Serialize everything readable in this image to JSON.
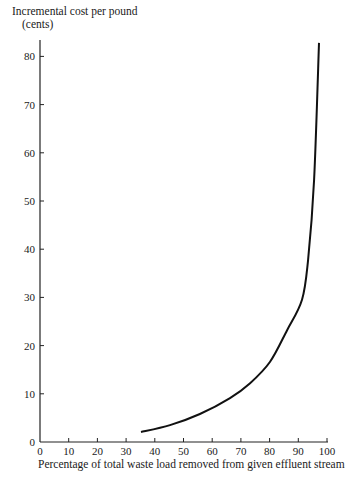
{
  "chart_data": {
    "type": "line",
    "title": "",
    "xlabel": "Percentage of total waste load removed from given effluent stream",
    "ylabel": "Incremental cost per pound",
    "ylabel_unit": "(cents)",
    "xlim": [
      0,
      100
    ],
    "ylim": [
      0,
      83
    ],
    "x_ticks": [
      0,
      10,
      20,
      30,
      40,
      50,
      60,
      70,
      80,
      90,
      100
    ],
    "y_ticks": [
      0,
      10,
      20,
      30,
      40,
      50,
      60,
      70,
      80
    ],
    "grid": false,
    "legend": "none",
    "series": [
      {
        "name": "Incremental cost curve",
        "x": [
          35.2,
          45.3,
          55.7,
          66.2,
          73.2,
          80.1,
          86.1,
          91.3,
          93.4,
          95.5,
          97.2
        ],
        "y": [
          2.1,
          3.5,
          5.8,
          9.1,
          12.2,
          16.6,
          23.2,
          29.5,
          37.8,
          54.4,
          82.8
        ]
      }
    ]
  }
}
